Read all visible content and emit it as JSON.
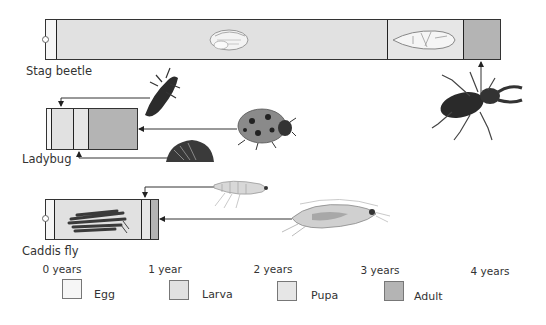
{
  "diagram": {
    "title": "",
    "type": "insect life cycle timeline",
    "axis": {
      "ticks": [
        {
          "label": "0 years",
          "value": 0
        },
        {
          "label": "1 year",
          "value": 1
        },
        {
          "label": "2 years",
          "value": 2
        },
        {
          "label": "3 years",
          "value": 3
        },
        {
          "label": "4 years",
          "value": 4
        }
      ]
    },
    "legend": [
      {
        "stage": "egg",
        "label": "Egg",
        "color": "#f6f6f6"
      },
      {
        "stage": "larva",
        "label": "Larva",
        "color": "#e1e1e1"
      },
      {
        "stage": "pupa",
        "label": "Pupa",
        "color": "#e6e6e6"
      },
      {
        "stage": "adult",
        "label": "Adult",
        "color": "#b4b4b4"
      }
    ],
    "species": [
      {
        "name": "Stag beetle",
        "stages_years": {
          "egg": 0.1,
          "larva": 3.1,
          "pupa": 0.7,
          "adult": 0.35
        },
        "illustrations": [
          "larva-grub",
          "pupa",
          "adult-stag-beetle"
        ]
      },
      {
        "name": "Ladybug",
        "stages_years": {
          "egg": 0.02,
          "larva": 0.2,
          "pupa": 0.14,
          "adult": 0.47
        },
        "illustrations": [
          "larva",
          "adult-ladybug",
          "pupa"
        ]
      },
      {
        "name": "Caddis fly",
        "stages_years": {
          "egg": 0.07,
          "larva": 0.82,
          "pupa": 0.08,
          "adult": 0.08
        },
        "illustrations": [
          "larva-in-case",
          "pupa",
          "adult-caddis-fly"
        ]
      }
    ]
  }
}
